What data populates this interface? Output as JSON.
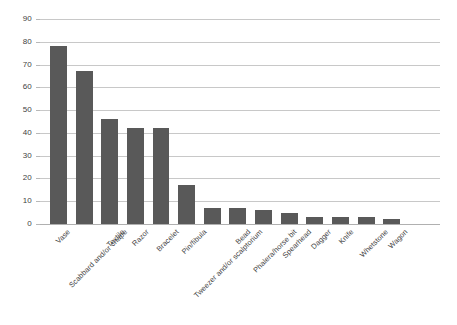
{
  "chart_data": {
    "type": "bar",
    "title": "",
    "subtitle": "",
    "xlabel": "",
    "ylabel": "",
    "ylim": [
      0,
      90
    ],
    "ytick_step": 10,
    "yticks": [
      90,
      80,
      70,
      60,
      50,
      40,
      30,
      20,
      10,
      0
    ],
    "grid": true,
    "legend": false,
    "legend_position": "none",
    "orientation": "vertical",
    "bar_color": "#595959",
    "gridline_color": "#c8c8c8",
    "categories": [
      "Vase",
      "Scabbard and/or chape",
      "Textile",
      "Razor",
      "Bracelet",
      "Pin/fibula",
      "Tweezer and/or scalptorium",
      "Bead",
      "Phalera/horse bit",
      "Spearhead",
      "Dagger",
      "Knife",
      "Whetstone",
      "Wagon"
    ],
    "values": [
      78,
      67,
      46,
      42,
      42,
      17,
      7,
      7,
      6,
      5,
      3,
      3,
      3,
      2
    ]
  }
}
